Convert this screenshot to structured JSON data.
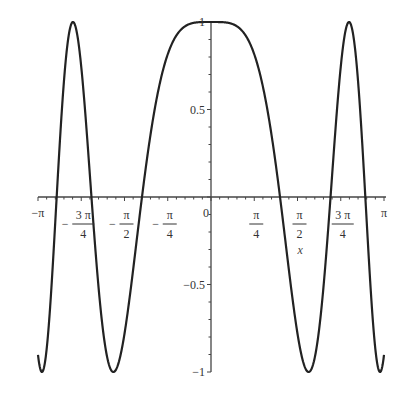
{
  "chart_data": {
    "type": "line",
    "title": "",
    "function": "cos(x^2)",
    "xlabel": "x",
    "ylabel": "",
    "xlim": [
      -3.14159,
      3.14159
    ],
    "ylim": [
      -1,
      1
    ],
    "grid": false,
    "legend": null,
    "x_ticks": [
      {
        "value": -3.14159,
        "label": "-π"
      },
      {
        "value": -2.35619,
        "label_num": "3 π",
        "label_den": "4",
        "sign": "-"
      },
      {
        "value": -1.5708,
        "label_num": "π",
        "label_den": "2",
        "sign": "-"
      },
      {
        "value": -0.7854,
        "label_num": "π",
        "label_den": "4",
        "sign": "-"
      },
      {
        "value": 0,
        "label": "0"
      },
      {
        "value": 0.7854,
        "label_num": "π",
        "label_den": "4",
        "sign": ""
      },
      {
        "value": 1.5708,
        "label_num": "π",
        "label_den": "2",
        "sign": ""
      },
      {
        "value": 2.35619,
        "label_num": "3 π",
        "label_den": "4",
        "sign": ""
      },
      {
        "value": 3.14159,
        "label": "π"
      }
    ],
    "y_ticks": [
      {
        "value": 1,
        "label": "1"
      },
      {
        "value": 0.5,
        "label": "0.5"
      },
      {
        "value": -0.5,
        "label": "-0.5"
      },
      {
        "value": -1,
        "label": "-1"
      }
    ],
    "series": [
      {
        "name": "cos(x^2)",
        "x": [
          -3.14159,
          -2.8,
          -2.507,
          -2.17,
          -1.772,
          -1.253,
          0,
          1.253,
          1.772,
          2.17,
          2.507,
          2.8,
          3.14159
        ],
        "values": [
          -0.9,
          0.0,
          1.0,
          0.0,
          -1.0,
          0.0,
          1.0,
          0.0,
          -1.0,
          0.0,
          1.0,
          0.0,
          -0.9
        ]
      }
    ],
    "color": "#222222"
  }
}
